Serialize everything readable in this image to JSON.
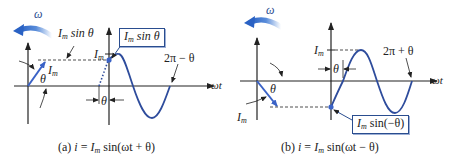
{
  "colors": {
    "wave": "#2e4c9c",
    "phasor": "#3a62c6",
    "axis": "#222222",
    "rotation_arrow": "#2f6fd0",
    "box_border": "#2a4d8f"
  },
  "panel_a": {
    "omega_label": "ω",
    "im_sin_theta_label_left": "sin θ",
    "im_sin_theta_label_left_I": "I",
    "im_sin_theta_label_left_sub": "m",
    "phasor_label_I": "I",
    "phasor_label_sub": "m",
    "theta_label": "θ",
    "im_tick_I": "I",
    "im_tick_sub": "m",
    "box_I": "I",
    "box_sub": "m",
    "box_text": " sin θ",
    "offset_theta": "θ",
    "zero_cross_label": "2π − θ",
    "axis_label": "ωt",
    "caption_prefix": "(a) ",
    "caption_i": "i",
    "caption_eq": " = ",
    "caption_I": "I",
    "caption_sub": "m",
    "caption_rest": " sin(ωt + θ)"
  },
  "panel_b": {
    "omega_label": "ω",
    "theta_label": "θ",
    "phasor_label_I": "I",
    "phasor_label_sub": "m",
    "im_tick_I": "I",
    "im_tick_sub": "m",
    "offset_theta": "θ",
    "zero_cross_label": "2π + θ",
    "axis_label": "ωt",
    "box_I": "I",
    "box_sub": "m",
    "box_text": " sin(−θ)",
    "caption_prefix": "(b) ",
    "caption_i": "i",
    "caption_eq": " = ",
    "caption_I": "I",
    "caption_sub": "m",
    "caption_rest": " sin(ωt − θ)"
  }
}
